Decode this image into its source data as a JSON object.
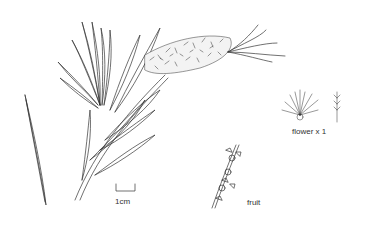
{
  "illustration": {
    "subject": "bottlebrush botanical line drawing",
    "ink_color": "#333333",
    "background": "#ffffff",
    "labels": {
      "scale_bar": "1cm",
      "flower": "flower x 1",
      "fruit": "fruit"
    },
    "parts": [
      "leafy-branch",
      "flower-spike",
      "single-leaf",
      "flower-detail",
      "stamen-detail",
      "fruit-stem",
      "scale-bar"
    ]
  }
}
